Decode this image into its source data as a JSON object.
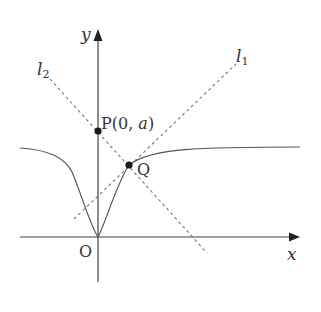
{
  "figure": {
    "labels": {
      "y_axis": "y",
      "x_axis": "x",
      "origin": "O",
      "line1": "l",
      "line1_sub": "1",
      "line2": "l",
      "line2_sub": "2",
      "point_p_prefix": "P(0, ",
      "point_p_var": "a",
      "point_p_suffix": ")",
      "point_q": "Q"
    },
    "colors": {
      "axis": "#444444",
      "curve": "#555555",
      "dashed": "#777777",
      "point": "#1a1a1a",
      "text": "#333333"
    }
  }
}
